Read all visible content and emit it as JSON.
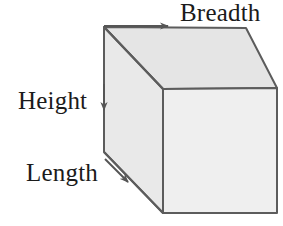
{
  "figure": {
    "name": "cuboid-dimensions-diagram",
    "background_color": "#ffffff",
    "width": 283,
    "height": 226,
    "shape": {
      "type": "cuboid",
      "outline_color": "#5c5c5c",
      "outline_width": 2,
      "faces": {
        "top": {
          "name": "top-face",
          "fill": "#e5e5e5",
          "points": "104,27 246,28 277,88 163,89"
        },
        "left": {
          "name": "left-face",
          "fill": "#e9e9e9",
          "points": "104,27 163,89 163,213 104,152"
        },
        "front": {
          "name": "front-face",
          "fill": "#efefef",
          "points": "163,89 277,88 277,213 163,213"
        }
      },
      "vertices": {
        "top_back_left": [
          104,
          27
        ],
        "top_back_right": [
          246,
          28
        ],
        "top_front_right": [
          277,
          88
        ],
        "top_front_left": [
          163,
          89
        ],
        "bottom_back_left": [
          104,
          152
        ],
        "bottom_front_left": [
          163,
          213
        ],
        "bottom_front_right": [
          277,
          213
        ]
      }
    },
    "arrows": {
      "breadth": {
        "name": "breadth-arrow",
        "direction": "right",
        "from": [
          104,
          26
        ],
        "to": [
          170,
          26
        ],
        "color": "#555555"
      },
      "height": {
        "name": "height-arrow",
        "direction": "down",
        "from": [
          104,
          84
        ],
        "to": [
          104,
          113
        ],
        "color": "#555555"
      },
      "length": {
        "name": "length-arrow",
        "direction": "down-right",
        "from": [
          105,
          159
        ],
        "to": [
          131,
          185
        ],
        "color": "#555555"
      }
    },
    "labels": {
      "breadth": "Breadth",
      "height": "Height",
      "length": "Length"
    }
  }
}
